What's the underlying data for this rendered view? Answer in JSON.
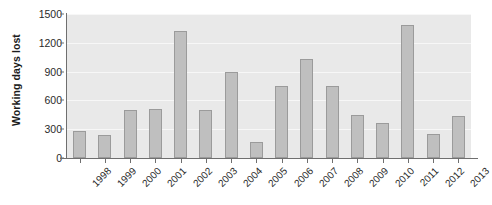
{
  "chart_data": {
    "type": "bar",
    "title": "",
    "xlabel": "",
    "ylabel": "Working days lost",
    "ylim": [
      0,
      1500
    ],
    "yticks": [
      0,
      300,
      600,
      900,
      1200,
      1500
    ],
    "ytick_labels": [
      "0",
      "300",
      "600",
      "900",
      "1200",
      "1500"
    ],
    "grid": true,
    "legend": "none",
    "categories": [
      "1998",
      "1999",
      "2000",
      "2001",
      "2002",
      "2003",
      "2004",
      "2005",
      "2006",
      "2007",
      "2008",
      "2009",
      "2010",
      "2011",
      "2012",
      "2013"
    ],
    "values": [
      280,
      240,
      500,
      510,
      1320,
      495,
      900,
      165,
      750,
      1030,
      755,
      450,
      365,
      1390,
      245,
      440
    ],
    "colors": {
      "bar_fill": "#bfbfbf",
      "bar_border": "#9b9b9b",
      "plot_background": "#e9e9e9",
      "gridline": "#f7f7f7",
      "axis": "#6f6f6f",
      "text": "#2a2a2a",
      "page_background": "#ffffff"
    }
  }
}
